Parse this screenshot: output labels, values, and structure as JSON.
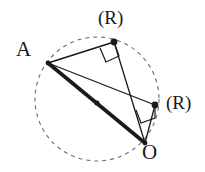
{
  "figure": {
    "width": 205,
    "height": 172,
    "background_color": "#ffffff",
    "stroke_color": "#1a1a1a",
    "dash_color": "#6e6e6e",
    "labels": {
      "point_a": "A",
      "point_o": "O",
      "right_angle_top": "(R)",
      "right_angle_right": "(R)"
    },
    "circle": {
      "name": "dashed-circumcircle",
      "cx": 97,
      "cy": 99,
      "r": 62,
      "style": "dashed",
      "dash_pattern": "4 4",
      "stroke_width": 1.1
    },
    "points": [
      {
        "name": "point-a",
        "label": "A",
        "x": 48,
        "y": 63,
        "dot": true,
        "dot_r": 2.4
      },
      {
        "name": "point-o",
        "label": "O",
        "x": 145,
        "y": 143,
        "dot": true,
        "dot_r": 2.4
      },
      {
        "name": "point-top-vertex",
        "label": "(R)",
        "x": 114,
        "y": 42,
        "dot": true,
        "dot_r": 3.4
      },
      {
        "name": "point-right-vertex",
        "label": "(R)",
        "x": 155,
        "y": 105,
        "dot": true,
        "dot_r": 3.4
      },
      {
        "name": "point-center",
        "label": "",
        "x": 97,
        "y": 103,
        "dot": true,
        "dot_r": 2.6
      }
    ],
    "segments": [
      {
        "name": "segment-a-to-o",
        "from": "point-a",
        "to": "point-o",
        "x1": 48,
        "y1": 63,
        "x2": 145,
        "y2": 143,
        "stroke_width": 3.6,
        "emphasis": "thick"
      },
      {
        "name": "segment-a-to-top",
        "from": "point-a",
        "to": "point-top-vertex",
        "x1": 48,
        "y1": 63,
        "x2": 114,
        "y2": 42,
        "stroke_width": 1.7,
        "emphasis": "normal"
      },
      {
        "name": "segment-top-to-o",
        "from": "point-top-vertex",
        "to": "point-o",
        "x1": 114,
        "y1": 42,
        "x2": 145,
        "y2": 143,
        "stroke_width": 1.3,
        "emphasis": "thin"
      },
      {
        "name": "segment-a-to-right",
        "from": "point-a",
        "to": "point-right-vertex",
        "x1": 48,
        "y1": 63,
        "x2": 155,
        "y2": 105,
        "stroke_width": 1.3,
        "emphasis": "thin"
      },
      {
        "name": "segment-right-to-o",
        "from": "point-right-vertex",
        "to": "point-o",
        "x1": 155,
        "y1": 105,
        "x2": 145,
        "y2": 143,
        "stroke_width": 1.3,
        "emphasis": "thin"
      }
    ],
    "right_angle_markers": [
      {
        "name": "right-angle-marker-top",
        "at_point": "point-top-vertex",
        "points": "100,48 106,62 119,56 114,42",
        "stroke_width": 1.2
      },
      {
        "name": "right-angle-marker-right",
        "at_point": "point-right-vertex",
        "points": "136,110 141,123 155,118 155,105",
        "stroke_width": 1.2
      }
    ]
  }
}
